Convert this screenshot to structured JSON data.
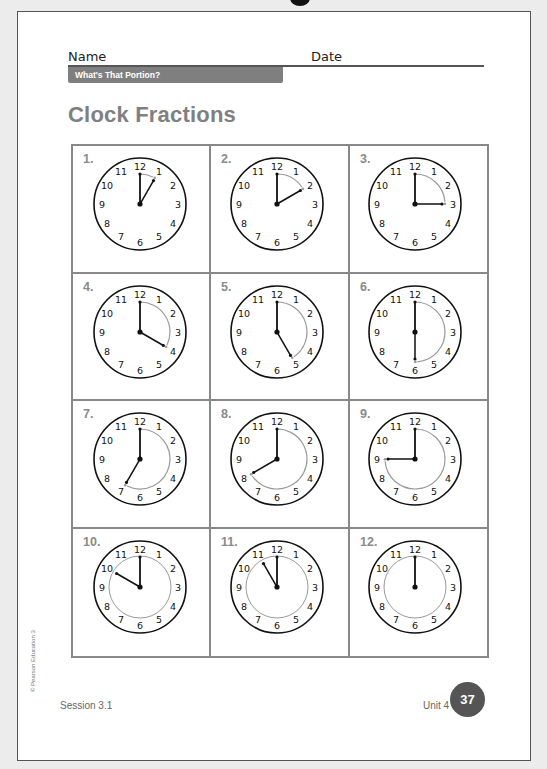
{
  "header": {
    "name_label": "Name",
    "date_label": "Date",
    "banner": "What's That Portion?"
  },
  "title": "Clock Fractions",
  "clocks": [
    {
      "number": "1.",
      "minute_hand_to": 12,
      "hour_hand_to": 1,
      "arc_to": 1,
      "inner_circle": false
    },
    {
      "number": "2.",
      "minute_hand_to": 12,
      "hour_hand_to": 2,
      "arc_to": 2,
      "inner_circle": false
    },
    {
      "number": "3.",
      "minute_hand_to": 12,
      "hour_hand_to": 3,
      "arc_to": 3,
      "inner_circle": false
    },
    {
      "number": "4.",
      "minute_hand_to": 12,
      "hour_hand_to": 4,
      "arc_to": 4,
      "inner_circle": false
    },
    {
      "number": "5.",
      "minute_hand_to": 12,
      "hour_hand_to": 5,
      "arc_to": 5,
      "inner_circle": false
    },
    {
      "number": "6.",
      "minute_hand_to": 12,
      "hour_hand_to": 6,
      "arc_to": 6,
      "inner_circle": false
    },
    {
      "number": "7.",
      "minute_hand_to": 12,
      "hour_hand_to": 7,
      "arc_to": 7,
      "inner_circle": false
    },
    {
      "number": "8.",
      "minute_hand_to": 12,
      "hour_hand_to": 8,
      "arc_to": 8,
      "inner_circle": false
    },
    {
      "number": "9.",
      "minute_hand_to": 12,
      "hour_hand_to": 9,
      "arc_to": 9,
      "inner_circle": false
    },
    {
      "number": "10.",
      "minute_hand_to": 12,
      "hour_hand_to": 10,
      "arc_to": 10,
      "inner_circle": true
    },
    {
      "number": "11.",
      "minute_hand_to": 12,
      "hour_hand_to": 11,
      "arc_to": 11,
      "inner_circle": true
    },
    {
      "number": "12.",
      "minute_hand_to": 12,
      "hour_hand_to": 12,
      "arc_to": 12,
      "inner_circle": true
    }
  ],
  "clock_numerals": [
    "12",
    "1",
    "2",
    "3",
    "4",
    "5",
    "6",
    "7",
    "8",
    "9",
    "10",
    "11"
  ],
  "colors": {
    "arc": "#9a9a9a",
    "hands": "#111111",
    "banner": "#7f7f7f",
    "badge": "#555555"
  },
  "footer": {
    "copyright": "© Pearson Education 3",
    "session": "Session 3.1",
    "unit": "Unit 4",
    "page_number": "37"
  }
}
